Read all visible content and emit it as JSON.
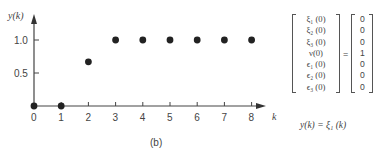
{
  "figure": {
    "panel_label": "(b)",
    "state_vector": {
      "lhs": [
        "ξ₁ (0)",
        "ξ₂ (0)",
        "ξ₃ (0)",
        "ν(0)",
        "ϵ₁ (0)",
        "ϵ₂ (0)",
        "ϵ₃ (0)"
      ],
      "equals": "=",
      "rhs": [
        "0",
        "0",
        "0",
        "1",
        "0",
        "0",
        "0"
      ]
    },
    "output_equation": "y(k) = ξ₁ (k)"
  },
  "chart_data": {
    "type": "scatter",
    "title": "",
    "xlabel": "k",
    "ylabel": "y(k)",
    "x": [
      0,
      1,
      2,
      3,
      4,
      5,
      6,
      7,
      8
    ],
    "values": [
      0,
      0,
      0.67,
      1.0,
      1.0,
      1.0,
      1.0,
      1.0,
      1.0
    ],
    "x_ticks": [
      "0",
      "1",
      "2",
      "3",
      "4",
      "5",
      "6",
      "7",
      "8"
    ],
    "y_ticks": [
      "0.5",
      "1.0"
    ],
    "xlim": [
      0,
      8.5
    ],
    "ylim": [
      0,
      1.2
    ],
    "grid": false,
    "legend": null,
    "marker_color": "#222222"
  }
}
